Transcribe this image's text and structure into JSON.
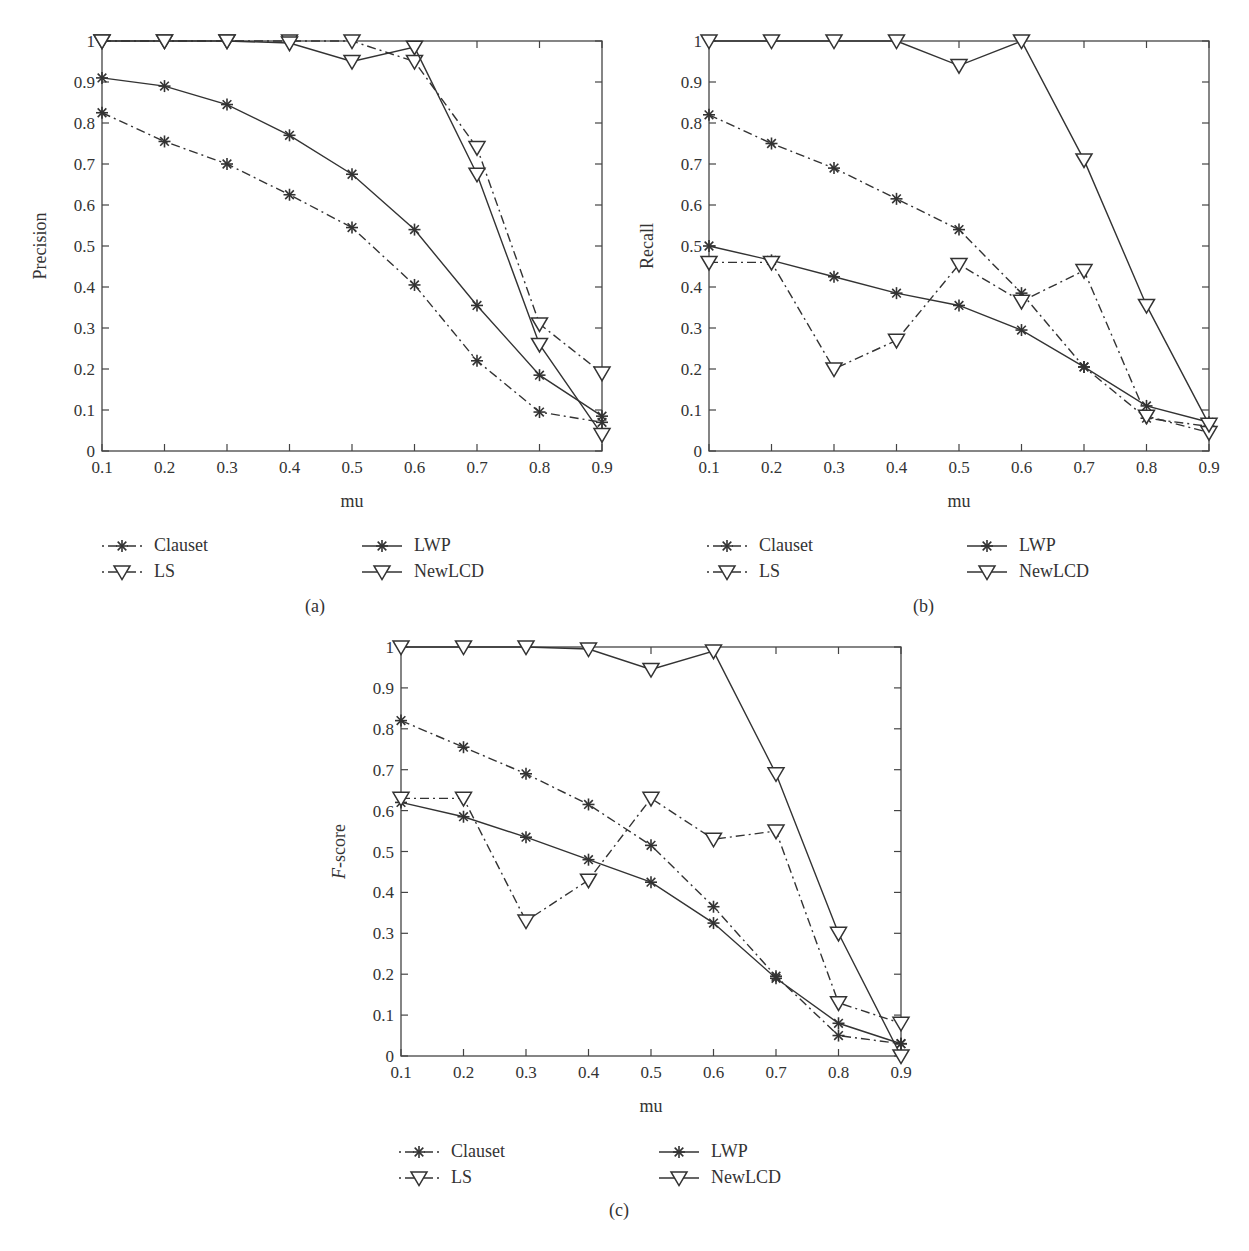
{
  "figure": {
    "panels": [
      {
        "id": "a",
        "caption": "(a)",
        "ylabel": "Precision",
        "xlabel": "mu"
      },
      {
        "id": "b",
        "caption": "(b)",
        "ylabel": "Recall",
        "xlabel": "mu"
      },
      {
        "id": "c",
        "caption": "(c)",
        "ylabel": "F-score",
        "ylabel_italic_part": "F",
        "ylabel_rest": "-score",
        "xlabel": "mu"
      }
    ],
    "legend": [
      {
        "name": "Clauset",
        "marker": "asterisk",
        "line": "dashdot"
      },
      {
        "name": "LWP",
        "marker": "asterisk",
        "line": "solid"
      },
      {
        "name": "LS",
        "marker": "triangle-down",
        "line": "dashdot"
      },
      {
        "name": "NewLCD",
        "marker": "triangle-down",
        "line": "solid"
      }
    ],
    "colors": {
      "line": "#333333",
      "axis": "#444444",
      "background": "#ffffff"
    }
  },
  "chart_data": [
    {
      "type": "line",
      "title": "(a)",
      "xlabel": "mu",
      "ylabel": "Precision",
      "x": [
        0.1,
        0.2,
        0.3,
        0.4,
        0.5,
        0.6,
        0.7,
        0.8,
        0.9
      ],
      "xticks": [
        "0.1",
        "0.2",
        "0.3",
        "0.4",
        "0.5",
        "0.6",
        "0.7",
        "0.8",
        "0.9"
      ],
      "yticks": [
        "0",
        "0.1",
        "0.2",
        "0.3",
        "0.4",
        "0.5",
        "0.6",
        "0.7",
        "0.8",
        "0.9",
        "1"
      ],
      "xlim": [
        0.1,
        0.9
      ],
      "ylim": [
        0,
        1
      ],
      "grid": false,
      "legend_position": "below",
      "series": [
        {
          "name": "Clauset",
          "values": [
            0.825,
            0.755,
            0.7,
            0.625,
            0.545,
            0.405,
            0.22,
            0.095,
            0.07
          ]
        },
        {
          "name": "LWP",
          "values": [
            0.91,
            0.89,
            0.845,
            0.77,
            0.675,
            0.54,
            0.355,
            0.185,
            0.085
          ]
        },
        {
          "name": "LS",
          "values": [
            1.0,
            1.0,
            1.0,
            1.0,
            1.0,
            0.95,
            0.74,
            0.31,
            0.19
          ]
        },
        {
          "name": "NewLCD",
          "values": [
            1.0,
            1.0,
            1.0,
            0.995,
            0.95,
            0.985,
            0.675,
            0.26,
            0.04
          ]
        }
      ]
    },
    {
      "type": "line",
      "title": "(b)",
      "xlabel": "mu",
      "ylabel": "Recall",
      "x": [
        0.1,
        0.2,
        0.3,
        0.4,
        0.5,
        0.6,
        0.7,
        0.8,
        0.9
      ],
      "xticks": [
        "0.1",
        "0.2",
        "0.3",
        "0.4",
        "0.5",
        "0.6",
        "0.7",
        "0.8",
        "0.9"
      ],
      "yticks": [
        "0",
        "0.1",
        "0.2",
        "0.3",
        "0.4",
        "0.5",
        "0.6",
        "0.7",
        "0.8",
        "0.9",
        "1"
      ],
      "xlim": [
        0.1,
        0.9
      ],
      "ylim": [
        0,
        1
      ],
      "grid": false,
      "legend_position": "below",
      "series": [
        {
          "name": "Clauset",
          "values": [
            0.82,
            0.75,
            0.69,
            0.615,
            0.54,
            0.385,
            0.205,
            0.08,
            0.06
          ]
        },
        {
          "name": "LWP",
          "values": [
            0.5,
            0.465,
            0.425,
            0.385,
            0.355,
            0.295,
            0.205,
            0.11,
            0.07
          ]
        },
        {
          "name": "LS",
          "values": [
            0.46,
            0.46,
            0.2,
            0.27,
            0.455,
            0.365,
            0.44,
            0.085,
            0.045
          ]
        },
        {
          "name": "NewLCD",
          "values": [
            1.0,
            1.0,
            1.0,
            1.0,
            0.94,
            1.0,
            0.71,
            0.355,
            0.065
          ]
        }
      ]
    },
    {
      "type": "line",
      "title": "(c)",
      "xlabel": "mu",
      "ylabel": "F-score",
      "x": [
        0.1,
        0.2,
        0.3,
        0.4,
        0.5,
        0.6,
        0.7,
        0.8,
        0.9
      ],
      "xticks": [
        "0.1",
        "0.2",
        "0.3",
        "0.4",
        "0.5",
        "0.6",
        "0.7",
        "0.8",
        "0.9"
      ],
      "yticks": [
        "0",
        "0.1",
        "0.2",
        "0.3",
        "0.4",
        "0.5",
        "0.6",
        "0.7",
        "0.8",
        "0.9",
        "1"
      ],
      "xlim": [
        0.1,
        0.9
      ],
      "ylim": [
        0,
        1
      ],
      "grid": false,
      "legend_position": "below",
      "series": [
        {
          "name": "Clauset",
          "values": [
            0.82,
            0.755,
            0.69,
            0.615,
            0.515,
            0.365,
            0.195,
            0.05,
            0.03
          ]
        },
        {
          "name": "LWP",
          "values": [
            0.62,
            0.585,
            0.535,
            0.48,
            0.425,
            0.325,
            0.19,
            0.08,
            0.03
          ]
        },
        {
          "name": "LS",
          "values": [
            0.63,
            0.63,
            0.33,
            0.43,
            0.63,
            0.53,
            0.55,
            0.13,
            0.08
          ]
        },
        {
          "name": "NewLCD",
          "values": [
            1.0,
            1.0,
            1.0,
            0.995,
            0.945,
            0.99,
            0.69,
            0.3,
            0.0
          ]
        }
      ]
    }
  ]
}
